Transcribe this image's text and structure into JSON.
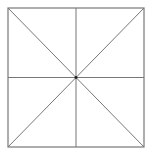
{
  "diagram": {
    "type": "subdivided-square",
    "square": {
      "x1": 8,
      "y1": 8,
      "x2": 144,
      "y2": 147
    },
    "center": {
      "x": 76,
      "y": 77.5
    },
    "line_color": "#777777",
    "center_dot_color": "#222222",
    "background": "#ffffff",
    "lines": [
      {
        "name": "vertical-midline",
        "x1": 76,
        "y1": 8,
        "x2": 76,
        "y2": 147
      },
      {
        "name": "horizontal-midline",
        "x1": 8,
        "y1": 77.5,
        "x2": 144,
        "y2": 77.5
      },
      {
        "name": "diagonal-main",
        "x1": 8,
        "y1": 8,
        "x2": 144,
        "y2": 147
      },
      {
        "name": "diagonal-anti",
        "x1": 144,
        "y1": 8,
        "x2": 8,
        "y2": 147
      }
    ]
  }
}
